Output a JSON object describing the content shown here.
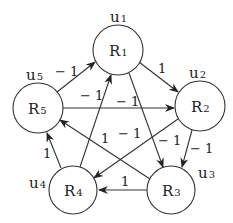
{
  "diagram": {
    "type": "directed-signed-graph",
    "nodes": [
      {
        "id": "R1",
        "letter": "R",
        "sub": "1",
        "u_letter": "u",
        "u_sub": "1",
        "cx": 118,
        "cy": 50,
        "r": 25
      },
      {
        "id": "R2",
        "letter": "R",
        "sub": "2",
        "u_letter": "u",
        "u_sub": "2",
        "cx": 200,
        "cy": 106,
        "r": 25
      },
      {
        "id": "R3",
        "letter": "R",
        "sub": "3",
        "u_letter": "u",
        "u_sub": "3",
        "cx": 171,
        "cy": 190,
        "r": 24
      },
      {
        "id": "R4",
        "letter": "R",
        "sub": "4",
        "u_letter": "u",
        "u_sub": "4",
        "cx": 73,
        "cy": 190,
        "r": 24
      },
      {
        "id": "R5",
        "letter": "R",
        "sub": "5",
        "u_letter": "u",
        "u_sub": "5",
        "cx": 38,
        "cy": 108,
        "r": 25
      }
    ],
    "edges": [
      {
        "from": "R5",
        "to": "R1",
        "weight": "− 1"
      },
      {
        "from": "R4",
        "to": "R1",
        "weight": "− 1"
      },
      {
        "from": "R1",
        "to": "R2",
        "weight": "1"
      },
      {
        "from": "R1",
        "to": "R3",
        "weight": "− 1"
      },
      {
        "from": "R5",
        "to": "R2",
        "weight": "− 1"
      },
      {
        "from": "R2",
        "to": "R4",
        "weight": "− 1"
      },
      {
        "from": "R2",
        "to": "R3",
        "weight": "− 1"
      },
      {
        "from": "R3",
        "to": "R5",
        "weight": "1"
      },
      {
        "from": "R3",
        "to": "R4",
        "weight": "1"
      },
      {
        "from": "R4",
        "to": "R5",
        "weight": "1"
      }
    ]
  },
  "labels": {
    "node_letter": "R",
    "u_letter": "u",
    "n1": "1",
    "n2": "2",
    "n3": "3",
    "n4": "4",
    "n5": "5",
    "w_r5_r1": "− 1",
    "w_r4_r1": "− 1",
    "w_r1_r2": "1",
    "w_r1_r3": "− 1",
    "w_r5_r2": "− 1",
    "w_r2_r4": "− 1",
    "w_r2_r3": "− 1",
    "w_r3_r5": "1",
    "w_r3_r4": "1",
    "w_r4_r5": "1"
  },
  "colors": {
    "stroke": "#333333",
    "text": "#222222",
    "background": "#ffffff"
  }
}
